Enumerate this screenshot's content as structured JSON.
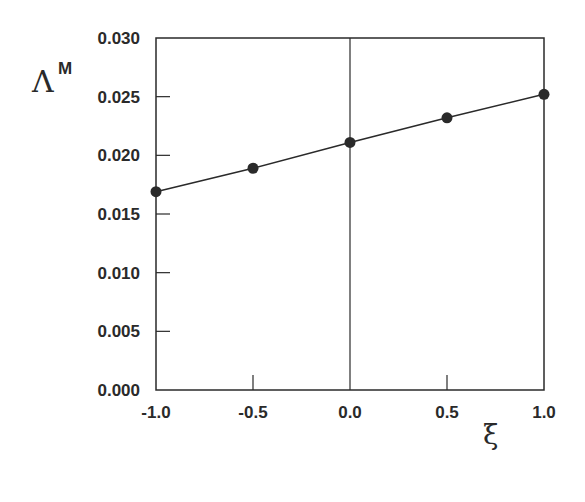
{
  "chart_data": {
    "type": "line",
    "title": "",
    "xlabel": "ξ",
    "ylabel": "Λ",
    "ylabel_superscript": "M",
    "x": [
      -1.0,
      -0.5,
      0.0,
      0.5,
      1.0
    ],
    "series": [
      {
        "name": "Λ^M",
        "values": [
          0.0169,
          0.0189,
          0.0211,
          0.0232,
          0.0252
        ],
        "marker": "filled-circle"
      }
    ],
    "xlim": [
      -1.0,
      1.0
    ],
    "ylim": [
      0.0,
      0.03
    ],
    "x_ticks": [
      "-1.0",
      "-0.5",
      "0.0",
      "0.5",
      "1.0"
    ],
    "y_ticks": [
      "0.000",
      "0.005",
      "0.010",
      "0.015",
      "0.020",
      "0.025",
      "0.030"
    ],
    "grid": false,
    "reference_line": {
      "orientation": "vertical",
      "x": 0.0
    },
    "legend": "none",
    "colors": {
      "line": "#2a2a2a",
      "marker": "#2a2a2a",
      "axes": "#2a2a2a"
    }
  }
}
